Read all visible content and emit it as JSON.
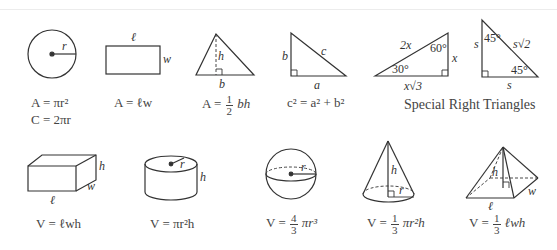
{
  "row1": {
    "circle": {
      "label_r": "r",
      "formula_area": "A = πr²",
      "formula_circ": "C = 2πr"
    },
    "rectangle": {
      "label_l": "ℓ",
      "label_w": "w",
      "formula": "A = ℓw"
    },
    "triangle": {
      "label_h": "h",
      "label_b": "b",
      "formula_prefix": "A =",
      "frac_num": "1",
      "frac_den": "2",
      "formula_suffix": "bh"
    },
    "pythagorean": {
      "label_a": "a",
      "label_b": "b",
      "label_c": "c",
      "formula": "c² = a² + b²"
    },
    "special_30_60_90": {
      "hyp": "2x",
      "short": "x",
      "long": "x√3",
      "angle_a": "30°",
      "angle_b": "60°"
    },
    "special_45_45_90": {
      "leg1": "s",
      "leg2": "s",
      "hyp": "s√2",
      "angle_a": "45°",
      "angle_b": "45°"
    },
    "special_caption": "Special Right Triangles"
  },
  "row2": {
    "box": {
      "label_l": "ℓ",
      "label_w": "w",
      "label_h": "h",
      "formula": "V = ℓwh"
    },
    "cylinder": {
      "label_r": "r",
      "label_h": "h",
      "formula": "V = πr²h"
    },
    "sphere": {
      "label_r": "r",
      "formula_prefix": "V =",
      "frac_num": "4",
      "frac_den": "3",
      "formula_suffix": "πr³"
    },
    "cone": {
      "label_r": "r",
      "label_h": "h",
      "formula_prefix": "V =",
      "frac_num": "1",
      "frac_den": "3",
      "formula_suffix": "πr²h"
    },
    "pyramid": {
      "label_l": "ℓ",
      "label_w": "w",
      "label_h": "h",
      "formula_prefix": "V =",
      "frac_num": "1",
      "frac_den": "3",
      "formula_suffix": "ℓwh"
    }
  }
}
